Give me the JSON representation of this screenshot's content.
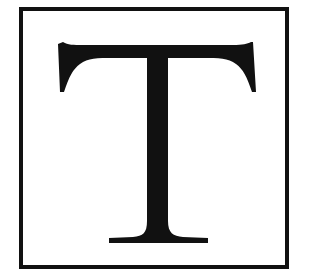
{
  "symbol": {
    "letter": "T",
    "color": "#111111",
    "frame_color": "#111111"
  }
}
